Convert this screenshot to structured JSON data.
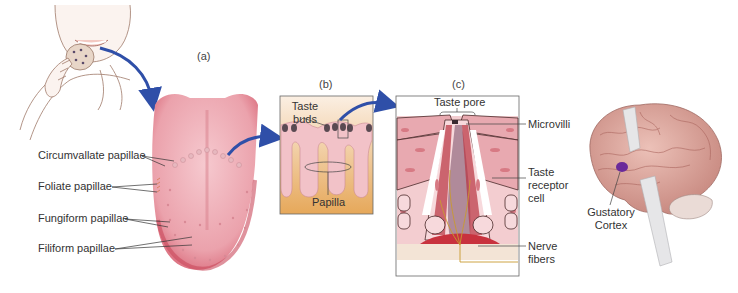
{
  "figure": {
    "panels": [
      {
        "id": "a",
        "label": "(a)",
        "subject": "tongue"
      },
      {
        "id": "b",
        "label": "(b)",
        "subject": "papilla cross-section"
      },
      {
        "id": "c",
        "label": "(c)",
        "subject": "taste bud"
      }
    ],
    "tongue_labels": {
      "circumvallate": "Circumvallate papillae",
      "foliate": "Foliate papillae",
      "fungiform": "Fungiform papillae",
      "filiform": "Filiform papillae"
    },
    "papilla_labels": {
      "taste_buds_line1": "Taste",
      "taste_buds_line2": "buds",
      "papilla": "Papilla"
    },
    "taste_bud_labels": {
      "taste_pore": "Taste pore",
      "microvilli": "Microvilli",
      "receptor_line1": "Taste",
      "receptor_line2": "receptor",
      "receptor_line3": "cell",
      "nerve_line1": "Nerve",
      "nerve_line2": "fibers"
    },
    "brain_labels": {
      "gustatory_line1": "Gustatory",
      "gustatory_line2": "Cortex"
    },
    "colors": {
      "arrow": "#2f4fa8",
      "tongue": "#e89aa4",
      "tongue_edge": "#c94a5c",
      "papilla_tissue": "#f2c2c8",
      "base_tan": "#e9b36a",
      "cell_red": "#b8323e",
      "brain": "#d9a39a",
      "gustatory": "#6a2a9a"
    }
  }
}
